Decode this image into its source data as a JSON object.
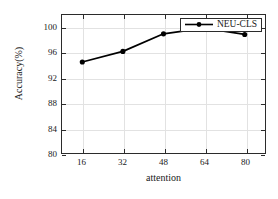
{
  "chart_data": {
    "type": "line",
    "title": "",
    "xlabel": "attention",
    "ylabel": "Accuracy(%)",
    "x": [
      16,
      32,
      48,
      64,
      80
    ],
    "xticks": [
      "16",
      "32",
      "48",
      "64",
      "80"
    ],
    "yticks": [
      "80",
      "84",
      "88",
      "92",
      "96",
      "100"
    ],
    "xlim": [
      8,
      88
    ],
    "ylim": [
      80,
      102
    ],
    "grid": true,
    "legend_position": "top-right",
    "series": [
      {
        "name": "NEU-CLS",
        "values": [
          94.5,
          96.2,
          99.0,
          99.9,
          98.9
        ],
        "color": "#000000",
        "marker": "circle"
      }
    ]
  },
  "legend": {
    "label": "NEU-CLS"
  },
  "axes": {
    "x_title": "attention",
    "y_title": "Accuracy(%)"
  }
}
